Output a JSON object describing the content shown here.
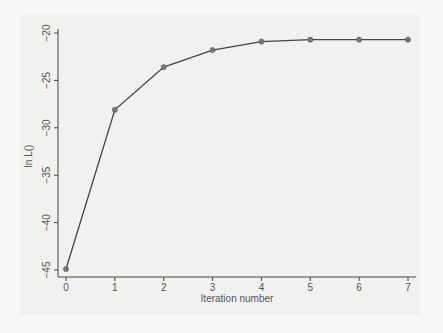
{
  "chart_data": {
    "type": "line",
    "title": "",
    "xlabel": "Iteration number",
    "ylabel": "ln L()",
    "x": [
      0,
      1,
      2,
      3,
      4,
      5,
      6,
      7
    ],
    "series": [
      {
        "name": "ln L()",
        "values": [
          -44.9,
          -28.1,
          -23.6,
          -21.8,
          -20.9,
          -20.7,
          -20.7,
          -20.7
        ]
      }
    ],
    "xticks": [
      "0",
      "1",
      "2",
      "3",
      "4",
      "5",
      "6",
      "7"
    ],
    "yticks": [
      "-20",
      "-25",
      "-30",
      "-35",
      "-40",
      "-45"
    ],
    "xlim": [
      0,
      7
    ],
    "ylim": [
      -45,
      -20
    ],
    "grid": false,
    "legend": null,
    "colors": {
      "line": "#444444",
      "marker": "#777777",
      "axis": "#444444",
      "background": "#f1f1ef"
    }
  }
}
